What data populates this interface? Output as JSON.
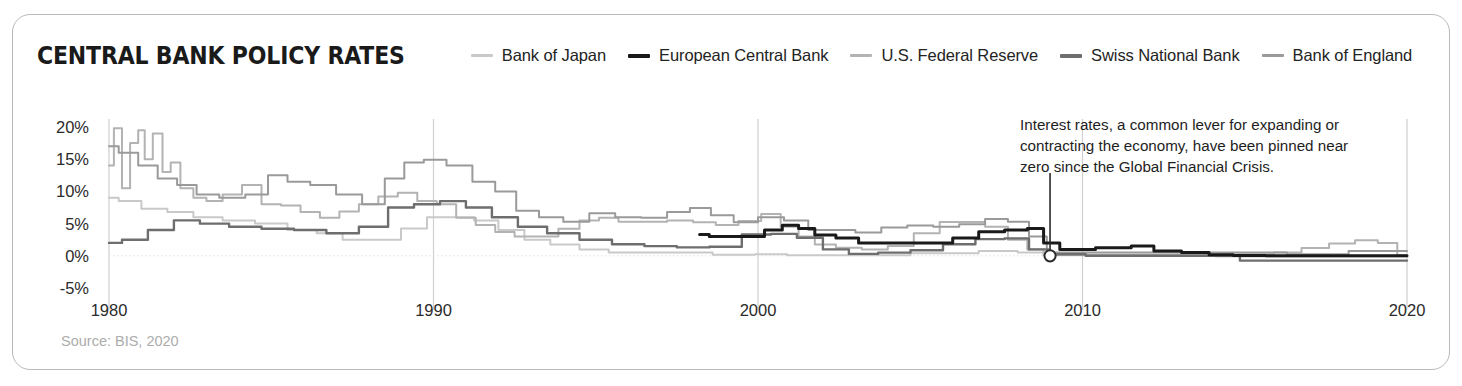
{
  "chart_title": "CENTRAL BANK POLICY RATES",
  "source_note": "Source: BIS, 2020",
  "annotation": {
    "text": "Interest rates, a common lever for expanding or contracting the economy, have been pinned near zero since the Global Financial Crisis.",
    "marker_x_year": 2009,
    "marker_y_value": 0
  },
  "colors": {
    "bank_of_japan": "#c9c9c9",
    "european_central_bank": "#1a1a1a",
    "us_federal_reserve": "#b3b3b3",
    "swiss_national_bank": "#6e6e6e",
    "bank_of_england": "#9a9a9a",
    "card_border": "#b9b9b9",
    "axis": "#cfcfcf",
    "text": "#232323",
    "source_text": "#adadad",
    "background": "#ffffff"
  },
  "legend": {
    "items": [
      {
        "label": "Bank of Japan",
        "color": "#c9c9c9",
        "weight": "thin"
      },
      {
        "label": "European Central Bank",
        "color": "#1a1a1a",
        "weight": "thick"
      },
      {
        "label": "U.S. Federal Reserve",
        "color": "#b3b3b3",
        "weight": "thin"
      },
      {
        "label": "Swiss National Bank",
        "color": "#6e6e6e",
        "weight": "thick"
      },
      {
        "label": "Bank of England",
        "color": "#9a9a9a",
        "weight": "thin"
      }
    ]
  },
  "chart_data": {
    "type": "line",
    "title": "CENTRAL BANK POLICY RATES",
    "subtitle": "",
    "xlabel": "",
    "ylabel": "",
    "xlim": [
      1980,
      2020
    ],
    "ylim": [
      -5,
      20
    ],
    "yunit": "%",
    "grid": "vertical-decade-lines-plus-zero-line",
    "legend_position": "top-inline-with-title",
    "ytick_labels": [
      "20%",
      "15%",
      "10%",
      "5%",
      "0%",
      "-5%"
    ],
    "ytick_values": [
      20,
      15,
      10,
      5,
      0,
      -5
    ],
    "xtick_labels": [
      "1980",
      "1990",
      "2000",
      "2010",
      "2020"
    ],
    "xtick_values": [
      1980,
      1990,
      2000,
      2010,
      2020
    ],
    "annotations": [
      {
        "text": "Interest rates, a common lever for expanding or contracting the economy, have been pinned near zero since the Global Financial Crisis.",
        "x": 2009,
        "y": 0,
        "marker": "open-circle"
      }
    ],
    "series": [
      {
        "name": "U.S. Federal Reserve",
        "color": "#b3b3b3",
        "x": [
          1980.0,
          1980.3,
          1980.5,
          1980.8,
          1981.0,
          1981.2,
          1981.5,
          1981.8,
          1982.0,
          1982.4,
          1982.8,
          1983.2,
          1983.8,
          1984.4,
          1985.0,
          1985.6,
          1986.2,
          1986.8,
          1987.4,
          1988.0,
          1988.6,
          1989.2,
          1989.8,
          1990.4,
          1991.0,
          1991.6,
          1992.2,
          1992.8,
          1993.5,
          1994.2,
          1994.8,
          1995.4,
          1996.0,
          1996.8,
          1997.6,
          1998.4,
          1999.0,
          1999.8,
          2000.4,
          2001.0,
          2001.5,
          2002.0,
          2002.8,
          2003.6,
          2004.4,
          2005.2,
          2006.0,
          2006.6,
          2007.4,
          2008.0,
          2008.6,
          2009.0,
          2010.0,
          2012.0,
          2014.0,
          2015.5,
          2016.3,
          2017.2,
          2018.0,
          2018.8,
          2019.4,
          2020.0
        ],
        "y": [
          14.0,
          19.8,
          10.5,
          17.5,
          19.5,
          15.0,
          19.0,
          13.0,
          14.5,
          10.5,
          9.0,
          8.5,
          9.5,
          11.0,
          8.0,
          7.8,
          6.8,
          5.9,
          6.9,
          8.0,
          9.2,
          9.8,
          8.5,
          8.0,
          5.9,
          4.8,
          3.7,
          3.0,
          3.0,
          4.2,
          5.5,
          5.9,
          5.3,
          5.3,
          5.5,
          5.2,
          4.8,
          5.4,
          6.5,
          4.5,
          3.0,
          1.75,
          1.25,
          1.0,
          1.5,
          3.5,
          5.25,
          5.25,
          4.5,
          2.5,
          1.0,
          0.15,
          0.15,
          0.15,
          0.15,
          0.25,
          0.5,
          1.2,
          1.9,
          2.4,
          2.0,
          0.1
        ]
      },
      {
        "name": "Bank of England",
        "color": "#9a9a9a",
        "x": [
          1980.0,
          1980.6,
          1981.2,
          1981.8,
          1982.4,
          1983.0,
          1983.8,
          1984.6,
          1985.2,
          1985.8,
          1986.6,
          1987.4,
          1988.2,
          1988.8,
          1989.4,
          1990.0,
          1990.8,
          1991.6,
          1992.2,
          1992.9,
          1993.6,
          1994.4,
          1995.2,
          1996.0,
          1996.8,
          1997.6,
          1998.2,
          1998.9,
          1999.6,
          2000.4,
          2001.2,
          2001.9,
          2002.6,
          2003.4,
          2004.2,
          2005.0,
          2005.8,
          2006.6,
          2007.4,
          2008.0,
          2008.7,
          2009.1,
          2012.0,
          2016.0,
          2016.6,
          2017.8,
          2018.6,
          2020.0
        ],
        "y": [
          17.0,
          16.0,
          14.0,
          12.0,
          11.0,
          9.5,
          9.0,
          9.5,
          12.5,
          11.5,
          11.0,
          9.5,
          8.0,
          12.0,
          14.5,
          14.9,
          14.0,
          11.5,
          10.0,
          7.0,
          6.0,
          5.3,
          6.6,
          6.0,
          5.9,
          6.8,
          7.4,
          6.3,
          5.2,
          6.0,
          5.5,
          4.0,
          4.0,
          3.6,
          4.4,
          4.7,
          4.5,
          4.9,
          5.7,
          5.3,
          3.0,
          0.5,
          0.5,
          0.5,
          0.25,
          0.25,
          0.75,
          0.75
        ]
      },
      {
        "name": "Bank of Japan",
        "color": "#c9c9c9",
        "x": [
          1980.0,
          1980.6,
          1981.4,
          1982.2,
          1983.0,
          1984.0,
          1985.0,
          1986.0,
          1986.8,
          1987.6,
          1988.6,
          1989.4,
          1990.2,
          1990.9,
          1991.6,
          1992.4,
          1993.2,
          1994.0,
          1995.0,
          1995.8,
          1996.6,
          1998.0,
          1999.2,
          2000.6,
          2001.2,
          2003.0,
          2006.4,
          2007.2,
          2008.8,
          2009.2,
          2012.0,
          2016.2,
          2018.0,
          2020.0
        ],
        "y": [
          9.0,
          8.5,
          7.3,
          6.8,
          6.0,
          5.5,
          5.0,
          4.0,
          3.5,
          2.5,
          2.5,
          4.25,
          6.0,
          6.0,
          5.5,
          4.0,
          2.5,
          1.75,
          1.0,
          0.5,
          0.5,
          0.5,
          0.15,
          0.25,
          0.1,
          0.1,
          0.4,
          0.75,
          0.5,
          0.1,
          0.1,
          -0.1,
          -0.1,
          -0.1
        ]
      },
      {
        "name": "Swiss National Bank",
        "color": "#6e6e6e",
        "x": [
          1980.0,
          1980.8,
          1981.6,
          1982.4,
          1983.2,
          1984.2,
          1985.2,
          1986.2,
          1987.2,
          1988.2,
          1989.0,
          1989.8,
          1990.6,
          1991.4,
          1992.2,
          1993.0,
          1994.0,
          1995.0,
          1996.0,
          1997.0,
          1998.0,
          1999.0,
          2000.0,
          2000.8,
          2001.6,
          2002.4,
          2003.2,
          2004.2,
          2005.2,
          2006.2,
          2007.2,
          2008.0,
          2008.7,
          2009.2,
          2011.0,
          2014.6,
          2015.1,
          2020.0
        ],
        "y": [
          2.0,
          2.5,
          4.0,
          5.5,
          5.0,
          4.5,
          4.2,
          4.0,
          3.5,
          4.5,
          7.5,
          8.0,
          8.5,
          7.5,
          6.0,
          4.5,
          3.5,
          2.5,
          1.8,
          1.5,
          1.3,
          1.4,
          3.3,
          3.4,
          2.8,
          1.0,
          0.3,
          0.5,
          0.85,
          1.8,
          2.6,
          2.7,
          1.0,
          0.25,
          0.0,
          0.0,
          -0.75,
          -0.75
        ]
      },
      {
        "name": "European Central Bank",
        "color": "#1a1a1a",
        "x": [
          1998.2,
          1998.8,
          1999.4,
          1999.9,
          2000.5,
          2001.0,
          2001.5,
          2002.0,
          2002.8,
          2003.4,
          2004.5,
          2005.6,
          2006.4,
          2007.2,
          2008.0,
          2008.6,
          2009.0,
          2009.6,
          2011.2,
          2011.8,
          2012.6,
          2013.5,
          2014.3,
          2015.0,
          2016.3,
          2020.0
        ],
        "y": [
          3.3,
          3.0,
          3.0,
          3.0,
          4.0,
          4.75,
          4.25,
          3.25,
          2.75,
          2.0,
          2.0,
          2.0,
          2.75,
          3.75,
          4.0,
          4.25,
          2.0,
          1.0,
          1.25,
          1.5,
          0.75,
          0.5,
          0.15,
          0.05,
          0.0,
          0.0
        ]
      }
    ]
  }
}
